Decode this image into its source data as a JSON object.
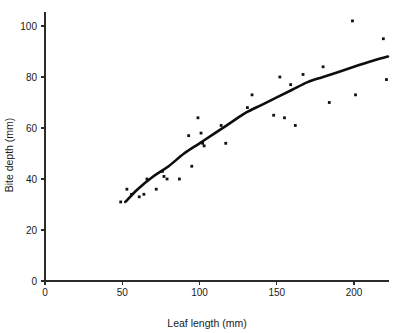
{
  "chart_data": {
    "type": "scatter",
    "title": "",
    "xlabel": "Leaf length (mm)",
    "ylabel": "Bite depth (mm)",
    "xlim": [
      0,
      226
    ],
    "ylim": [
      0,
      108
    ],
    "xticks": [
      0,
      50,
      100,
      150,
      200
    ],
    "yticks": [
      0,
      20,
      40,
      60,
      80,
      100
    ],
    "xtick_labels": [
      "0",
      "50",
      "100",
      "150",
      "200"
    ],
    "ytick_labels": [
      "0",
      "20",
      "40",
      "60",
      "80",
      "100"
    ],
    "grid": false,
    "legend": null,
    "points": [
      {
        "x": 49,
        "y": 31
      },
      {
        "x": 53,
        "y": 36
      },
      {
        "x": 56,
        "y": 34
      },
      {
        "x": 61,
        "y": 33
      },
      {
        "x": 64,
        "y": 34
      },
      {
        "x": 66,
        "y": 40
      },
      {
        "x": 72,
        "y": 36
      },
      {
        "x": 76,
        "y": 43
      },
      {
        "x": 77,
        "y": 41
      },
      {
        "x": 79,
        "y": 40
      },
      {
        "x": 87,
        "y": 40
      },
      {
        "x": 93,
        "y": 57
      },
      {
        "x": 95,
        "y": 45
      },
      {
        "x": 99,
        "y": 64
      },
      {
        "x": 101,
        "y": 58
      },
      {
        "x": 102,
        "y": 54
      },
      {
        "x": 103,
        "y": 53
      },
      {
        "x": 114,
        "y": 61
      },
      {
        "x": 117,
        "y": 54
      },
      {
        "x": 131,
        "y": 68
      },
      {
        "x": 134,
        "y": 73
      },
      {
        "x": 148,
        "y": 65
      },
      {
        "x": 152,
        "y": 80
      },
      {
        "x": 155,
        "y": 64
      },
      {
        "x": 159,
        "y": 77
      },
      {
        "x": 162,
        "y": 61
      },
      {
        "x": 167,
        "y": 81
      },
      {
        "x": 180,
        "y": 84
      },
      {
        "x": 184,
        "y": 70
      },
      {
        "x": 199,
        "y": 102
      },
      {
        "x": 201,
        "y": 73
      },
      {
        "x": 219,
        "y": 95
      },
      {
        "x": 221,
        "y": 79
      }
    ],
    "fit_curve": {
      "label": "fitted curve",
      "points": [
        {
          "x": 52,
          "y": 31
        },
        {
          "x": 60,
          "y": 36
        },
        {
          "x": 70,
          "y": 41
        },
        {
          "x": 80,
          "y": 45
        },
        {
          "x": 90,
          "y": 50
        },
        {
          "x": 100,
          "y": 54
        },
        {
          "x": 110,
          "y": 58
        },
        {
          "x": 120,
          "y": 62
        },
        {
          "x": 130,
          "y": 66
        },
        {
          "x": 140,
          "y": 69
        },
        {
          "x": 150,
          "y": 72
        },
        {
          "x": 160,
          "y": 75
        },
        {
          "x": 170,
          "y": 78
        },
        {
          "x": 180,
          "y": 80
        },
        {
          "x": 190,
          "y": 82
        },
        {
          "x": 200,
          "y": 84
        },
        {
          "x": 210,
          "y": 86
        },
        {
          "x": 222,
          "y": 88
        }
      ]
    }
  }
}
